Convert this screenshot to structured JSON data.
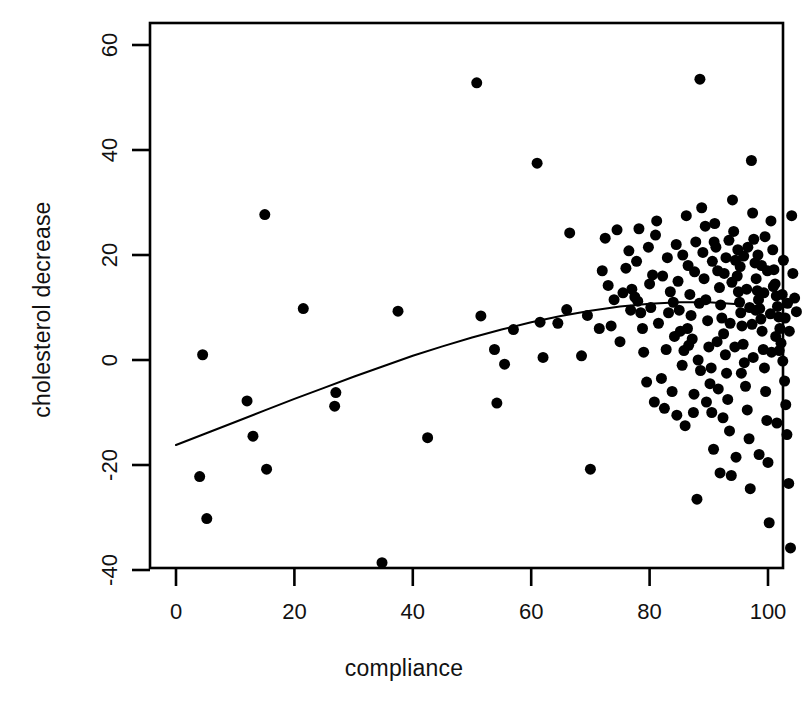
{
  "chart_data": {
    "type": "scatter",
    "title": "",
    "xlabel": "compliance",
    "ylabel": "cholesterol decrease",
    "xlim": [
      -4,
      108
    ],
    "ylim": [
      -46,
      66
    ],
    "xticks": [
      0,
      20,
      40,
      60,
      80,
      100
    ],
    "yticks": [
      -40,
      -20,
      0,
      20,
      40,
      60
    ],
    "grid": false,
    "legend": null,
    "marker": {
      "shape": "circle",
      "filled": true,
      "color": "#000000",
      "size_px": 11
    },
    "curve": {
      "name": "loess smooth",
      "color": "#000000",
      "width_px": 2,
      "x": [
        0,
        5,
        10,
        15,
        20,
        25,
        30,
        35,
        40,
        45,
        50,
        55,
        60,
        65,
        70,
        75,
        80,
        85,
        90,
        95,
        100
      ],
      "y": [
        -16.2,
        -14.0,
        -11.8,
        -9.6,
        -7.4,
        -5.3,
        -3.2,
        -1.2,
        0.8,
        2.6,
        4.3,
        5.8,
        7.2,
        8.4,
        9.4,
        10.2,
        10.7,
        11.0,
        11.0,
        10.6,
        10.0
      ]
    },
    "points": [
      [
        4.5,
        1.0
      ],
      [
        4.0,
        -22.2
      ],
      [
        5.2,
        -30.2
      ],
      [
        12.0,
        -7.8
      ],
      [
        13.0,
        -14.5
      ],
      [
        15.3,
        -20.8
      ],
      [
        15.0,
        27.7
      ],
      [
        21.5,
        9.8
      ],
      [
        26.8,
        -8.8
      ],
      [
        27.0,
        -6.2
      ],
      [
        34.8,
        -38.6
      ],
      [
        37.5,
        9.3
      ],
      [
        42.5,
        -14.8
      ],
      [
        50.8,
        52.8
      ],
      [
        51.5,
        8.4
      ],
      [
        53.8,
        2.0
      ],
      [
        54.2,
        -8.2
      ],
      [
        55.5,
        -0.8
      ],
      [
        57.0,
        5.8
      ],
      [
        61.0,
        37.5
      ],
      [
        61.5,
        7.2
      ],
      [
        62.0,
        0.5
      ],
      [
        64.5,
        7.0
      ],
      [
        66.0,
        9.6
      ],
      [
        68.5,
        0.8
      ],
      [
        70.0,
        -20.8
      ],
      [
        71.5,
        6.0
      ],
      [
        72.5,
        23.2
      ],
      [
        74.5,
        24.8
      ],
      [
        75.0,
        3.5
      ],
      [
        76.0,
        17.5
      ],
      [
        76.5,
        20.8
      ],
      [
        77.0,
        13.5
      ],
      [
        77.5,
        12.0
      ],
      [
        77.8,
        18.8
      ],
      [
        78.0,
        11.2
      ],
      [
        78.5,
        9.0
      ],
      [
        79.0,
        1.5
      ],
      [
        79.5,
        -4.2
      ],
      [
        80.0,
        14.5
      ],
      [
        80.2,
        10.0
      ],
      [
        80.5,
        16.2
      ],
      [
        81.0,
        23.8
      ],
      [
        81.5,
        7.0
      ],
      [
        82.0,
        -3.5
      ],
      [
        82.5,
        -9.2
      ],
      [
        83.0,
        19.5
      ],
      [
        83.5,
        13.0
      ],
      [
        84.0,
        11.0
      ],
      [
        84.5,
        22.0
      ],
      [
        84.8,
        15.0
      ],
      [
        85.0,
        9.5
      ],
      [
        85.2,
        5.5
      ],
      [
        85.5,
        -1.0
      ],
      [
        86.0,
        -12.5
      ],
      [
        86.2,
        27.5
      ],
      [
        86.5,
        18.0
      ],
      [
        86.8,
        12.5
      ],
      [
        87.0,
        8.5
      ],
      [
        87.2,
        4.0
      ],
      [
        87.5,
        -6.5
      ],
      [
        88.0,
        -26.5
      ],
      [
        88.5,
        53.5
      ],
      [
        88.8,
        29.0
      ],
      [
        89.0,
        20.5
      ],
      [
        89.2,
        15.5
      ],
      [
        89.5,
        11.5
      ],
      [
        89.8,
        7.5
      ],
      [
        90.0,
        2.5
      ],
      [
        90.2,
        -4.5
      ],
      [
        90.5,
        -10.0
      ],
      [
        90.8,
        -17.0
      ],
      [
        91.0,
        26.0
      ],
      [
        91.2,
        21.5
      ],
      [
        91.5,
        17.0
      ],
      [
        91.8,
        13.8
      ],
      [
        92.0,
        10.5
      ],
      [
        92.2,
        8.0
      ],
      [
        92.5,
        5.0
      ],
      [
        92.8,
        1.0
      ],
      [
        93.0,
        -2.5
      ],
      [
        93.2,
        -7.5
      ],
      [
        93.5,
        -13.5
      ],
      [
        93.8,
        -22.0
      ],
      [
        94.0,
        30.5
      ],
      [
        94.2,
        24.5
      ],
      [
        94.5,
        19.0
      ],
      [
        94.8,
        16.0
      ],
      [
        95.0,
        13.0
      ],
      [
        95.2,
        11.0
      ],
      [
        95.4,
        9.0
      ],
      [
        95.6,
        6.5
      ],
      [
        95.8,
        3.0
      ],
      [
        96.0,
        -0.5
      ],
      [
        96.2,
        -5.0
      ],
      [
        96.5,
        -9.5
      ],
      [
        96.8,
        -15.0
      ],
      [
        97.0,
        -24.5
      ],
      [
        97.2,
        38.0
      ],
      [
        97.4,
        28.0
      ],
      [
        97.6,
        23.0
      ],
      [
        97.8,
        18.5
      ],
      [
        98.0,
        15.5
      ],
      [
        98.2,
        13.2
      ],
      [
        98.4,
        11.5
      ],
      [
        98.6,
        9.8
      ],
      [
        98.8,
        7.8
      ],
      [
        99.0,
        5.5
      ],
      [
        99.2,
        2.0
      ],
      [
        99.4,
        -1.5
      ],
      [
        99.6,
        -6.0
      ],
      [
        99.8,
        -11.5
      ],
      [
        100.0,
        -19.5
      ],
      [
        100.2,
        -31.0
      ],
      [
        100.5,
        26.5
      ],
      [
        100.8,
        21.0
      ],
      [
        101.0,
        17.2
      ],
      [
        101.2,
        14.5
      ],
      [
        101.4,
        12.2
      ],
      [
        101.6,
        10.2
      ],
      [
        101.8,
        8.2
      ],
      [
        102.0,
        6.0
      ],
      [
        102.2,
        3.2
      ],
      [
        102.5,
        -0.2
      ],
      [
        102.8,
        -4.0
      ],
      [
        103.0,
        -8.5
      ],
      [
        103.2,
        -14.2
      ],
      [
        103.5,
        -23.5
      ],
      [
        103.8,
        -35.8
      ],
      [
        104.0,
        27.5
      ],
      [
        104.2,
        16.5
      ],
      [
        104.5,
        11.8
      ],
      [
        104.8,
        9.2
      ],
      [
        72.0,
        17.0
      ],
      [
        73.0,
        14.2
      ],
      [
        74.0,
        11.5
      ],
      [
        75.5,
        12.8
      ],
      [
        78.2,
        25.0
      ],
      [
        82.8,
        2.0
      ],
      [
        83.8,
        -6.0
      ],
      [
        85.8,
        1.8
      ],
      [
        88.2,
        0.0
      ],
      [
        90.6,
        18.8
      ],
      [
        92.6,
        16.5
      ],
      [
        94.6,
        -18.5
      ],
      [
        96.6,
        21.5
      ],
      [
        98.5,
        -18.0
      ],
      [
        100.6,
        1.5
      ],
      [
        101.5,
        -12.0
      ],
      [
        102.6,
        19.0
      ],
      [
        87.8,
        22.5
      ],
      [
        89.4,
        25.5
      ],
      [
        91.4,
        3.5
      ],
      [
        93.4,
        22.8
      ],
      [
        95.5,
        -2.5
      ],
      [
        97.5,
        0.5
      ],
      [
        99.5,
        23.5
      ],
      [
        66.5,
        24.2
      ],
      [
        69.5,
        8.5
      ],
      [
        81.2,
        26.5
      ],
      [
        86.6,
        2.8
      ],
      [
        88.6,
        -2.0
      ],
      [
        90.4,
        -1.5
      ],
      [
        92.4,
        -11.0
      ],
      [
        94.4,
        2.5
      ],
      [
        96.4,
        13.5
      ],
      [
        98.3,
        20.0
      ],
      [
        100.4,
        8.8
      ],
      [
        102.4,
        12.5
      ],
      [
        103.6,
        5.5
      ],
      [
        79.8,
        21.5
      ],
      [
        84.2,
        4.5
      ],
      [
        85.6,
        20.0
      ],
      [
        87.6,
        16.8
      ],
      [
        89.6,
        -8.0
      ],
      [
        91.6,
        -5.5
      ],
      [
        93.6,
        7.0
      ],
      [
        95.3,
        17.8
      ],
      [
        97.3,
        6.8
      ],
      [
        99.3,
        12.8
      ],
      [
        101.3,
        4.5
      ],
      [
        103.3,
        10.8
      ],
      [
        76.8,
        9.5
      ],
      [
        80.8,
        -8.0
      ],
      [
        82.2,
        16.0
      ],
      [
        84.6,
        -10.5
      ],
      [
        86.4,
        6.0
      ],
      [
        88.4,
        10.8
      ],
      [
        90.9,
        22.5
      ],
      [
        92.9,
        19.5
      ],
      [
        94.9,
        21.0
      ],
      [
        96.9,
        10.0
      ],
      [
        98.9,
        18.0
      ],
      [
        100.9,
        14.0
      ],
      [
        102.9,
        8.0
      ],
      [
        73.5,
        6.5
      ],
      [
        78.8,
        6.0
      ],
      [
        83.2,
        9.0
      ],
      [
        87.4,
        -10.0
      ],
      [
        91.9,
        -21.5
      ],
      [
        93.9,
        14.8
      ],
      [
        95.9,
        19.8
      ],
      [
        97.9,
        9.5
      ],
      [
        99.9,
        17.0
      ],
      [
        101.9,
        1.8
      ]
    ]
  },
  "axes": {
    "box_color": "#000000",
    "tick_len_px": 9,
    "x_tick_labels": [
      "0",
      "20",
      "40",
      "60",
      "80",
      "100"
    ],
    "y_tick_labels": [
      "-40",
      "-20",
      "0",
      "20",
      "40",
      "60"
    ]
  }
}
